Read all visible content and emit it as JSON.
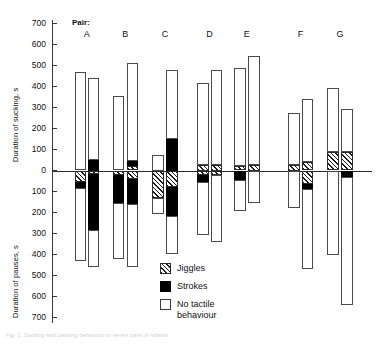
{
  "figure": {
    "pair_header": "Pair:",
    "caption": "Fig. 2. Sucking and pausing behaviour in seven pairs of infants.",
    "zero_label": "0"
  },
  "axes": {
    "top_axis_title": "Duration of sucking, s",
    "bottom_axis_title": "Duration of pauses, s",
    "tick_labels_top": [
      "700",
      "600",
      "500",
      "400",
      "300",
      "200",
      "100"
    ],
    "tick_labels_bottom": [
      "100",
      "200",
      "300",
      "400",
      "500",
      "600",
      "700"
    ],
    "unit": "s"
  },
  "legend": {
    "items": [
      {
        "key": "jiggles",
        "label": "Jiggles"
      },
      {
        "key": "strokes",
        "label": "Strokes"
      },
      {
        "key": "none",
        "label": "No tactile behaviour"
      }
    ]
  },
  "chart_data": {
    "type": "bar",
    "title": "",
    "subtitle": "",
    "xlabel": "Pair",
    "ylabel": "Duration of sucking, s / Duration of pauses, s",
    "ylim": [
      -700,
      700
    ],
    "grid": false,
    "legend_position": "bottom-center",
    "orientation": "vertical-stacked-diverging",
    "categories": [
      "A",
      "B",
      "C",
      "D",
      "E",
      "F",
      "G"
    ],
    "series": [
      {
        "name": "Jiggles",
        "color": "#1c1c1c-hatched"
      },
      {
        "name": "Strokes",
        "color": "#000000"
      },
      {
        "name": "No tactile behaviour",
        "color": "#ffffff"
      }
    ],
    "bars": [
      {
        "pair": "A",
        "infant": 1,
        "sucking": {
          "none": 470,
          "strokes": 0,
          "jiggles": 0,
          "total": 470
        },
        "pauses": {
          "jiggles": 55,
          "strokes": 30,
          "none": 345,
          "total": 430
        }
      },
      {
        "pair": "A",
        "infant": 2,
        "sucking": {
          "none": 390,
          "strokes": 50,
          "jiggles": 0,
          "total": 440
        },
        "pauses": {
          "jiggles": 15,
          "strokes": 270,
          "none": 175,
          "total": 460
        }
      },
      {
        "pair": "B",
        "infant": 1,
        "sucking": {
          "none": 355,
          "strokes": 0,
          "jiggles": 0,
          "total": 355
        },
        "pauses": {
          "jiggles": 20,
          "strokes": 135,
          "none": 265,
          "total": 420
        }
      },
      {
        "pair": "B",
        "infant": 2,
        "sucking": {
          "none": 465,
          "strokes": 25,
          "jiggles": 20,
          "total": 510
        },
        "pauses": {
          "jiggles": 40,
          "strokes": 120,
          "none": 300,
          "total": 460
        }
      },
      {
        "pair": "C",
        "infant": 1,
        "sucking": {
          "none": 75,
          "strokes": 0,
          "jiggles": 0,
          "total": 75
        },
        "pauses": {
          "jiggles": 130,
          "strokes": 0,
          "none": 75,
          "total": 205
        }
      },
      {
        "pair": "C",
        "infant": 2,
        "sucking": {
          "none": 330,
          "strokes": 150,
          "jiggles": 0,
          "total": 480
        },
        "pauses": {
          "jiggles": 80,
          "strokes": 135,
          "none": 185,
          "total": 400
        }
      },
      {
        "pair": "D",
        "infant": 1,
        "sucking": {
          "none": 390,
          "strokes": 0,
          "jiggles": 25,
          "total": 415
        },
        "pauses": {
          "jiggles": 20,
          "strokes": 35,
          "none": 250,
          "total": 305
        }
      },
      {
        "pair": "D",
        "infant": 2,
        "sucking": {
          "none": 455,
          "strokes": 0,
          "jiggles": 25,
          "total": 480
        },
        "pauses": {
          "jiggles": 20,
          "strokes": 0,
          "none": 320,
          "total": 340
        }
      },
      {
        "pair": "E",
        "infant": 1,
        "sucking": {
          "none": 470,
          "strokes": 0,
          "jiggles": 20,
          "total": 490
        },
        "pauses": {
          "jiggles": 0,
          "strokes": 45,
          "none": 150,
          "total": 195
        }
      },
      {
        "pair": "E",
        "infant": 2,
        "sucking": {
          "none": 520,
          "strokes": 0,
          "jiggles": 25,
          "total": 545
        },
        "pauses": {
          "jiggles": 0,
          "strokes": 0,
          "none": 155,
          "total": 155
        }
      },
      {
        "pair": "F",
        "infant": 1,
        "sucking": {
          "none": 250,
          "strokes": 0,
          "jiggles": 25,
          "total": 275
        },
        "pauses": {
          "jiggles": 0,
          "strokes": 0,
          "none": 180,
          "total": 180
        }
      },
      {
        "pair": "F",
        "infant": 2,
        "sucking": {
          "none": 300,
          "strokes": 0,
          "jiggles": 40,
          "total": 340
        },
        "pauses": {
          "jiggles": 65,
          "strokes": 25,
          "none": 380,
          "total": 470
        }
      },
      {
        "pair": "G",
        "infant": 1,
        "sucking": {
          "none": 305,
          "strokes": 0,
          "jiggles": 90,
          "total": 395
        },
        "pauses": {
          "jiggles": 0,
          "strokes": 0,
          "none": 400,
          "total": 400
        }
      },
      {
        "pair": "G",
        "infant": 2,
        "sucking": {
          "none": 205,
          "strokes": 0,
          "jiggles": 90,
          "total": 295
        },
        "pauses": {
          "jiggles": 0,
          "strokes": 30,
          "none": 610,
          "total": 640
        }
      }
    ]
  }
}
